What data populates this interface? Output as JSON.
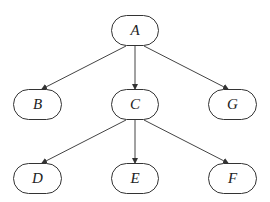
{
  "diagram": {
    "type": "tree",
    "nodes": [
      {
        "id": "A",
        "label": "A",
        "x": 111,
        "y": 15,
        "w": 48,
        "h": 31
      },
      {
        "id": "B",
        "label": "B",
        "x": 13,
        "y": 89,
        "w": 49,
        "h": 31
      },
      {
        "id": "C",
        "label": "C",
        "x": 111,
        "y": 89,
        "w": 48,
        "h": 31
      },
      {
        "id": "G",
        "label": "G",
        "x": 208,
        "y": 89,
        "w": 49,
        "h": 31
      },
      {
        "id": "D",
        "label": "D",
        "x": 13,
        "y": 163,
        "w": 49,
        "h": 31
      },
      {
        "id": "E",
        "label": "E",
        "x": 111,
        "y": 163,
        "w": 48,
        "h": 31
      },
      {
        "id": "F",
        "label": "F",
        "x": 208,
        "y": 163,
        "w": 49,
        "h": 31
      }
    ],
    "edges": [
      {
        "from": "A",
        "to": "B"
      },
      {
        "from": "A",
        "to": "C"
      },
      {
        "from": "A",
        "to": "G"
      },
      {
        "from": "C",
        "to": "D"
      },
      {
        "from": "C",
        "to": "E"
      },
      {
        "from": "C",
        "to": "F"
      }
    ]
  }
}
